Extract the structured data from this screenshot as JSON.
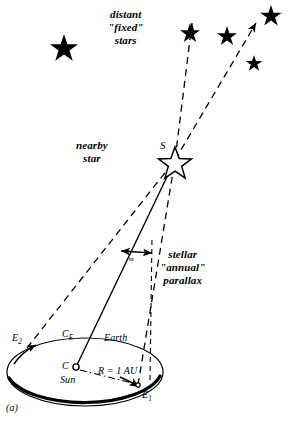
{
  "figure": {
    "panel_label": "(a)",
    "title_implicit": "stellar annual parallax geometry",
    "background_color": "#ffffff",
    "ink_color": "#000000"
  },
  "labels": {
    "distant_stars_line1": "distant",
    "distant_stars_line2": "\"fixed\"",
    "distant_stars_line3": "stars",
    "nearby_star_line1": "nearby",
    "nearby_star_line2": "star",
    "star_symbol": "S",
    "parallax_line1": "stellar",
    "parallax_line2": "\"annual\"",
    "parallax_line3": "parallax",
    "parallax_angle_symbol": "ϖ",
    "earth_position_2": "E",
    "earth_position_2_sub": "2",
    "orbit_center_label": "C",
    "orbit_center_sub": "E",
    "earth": "Earth",
    "sun_center": "C",
    "sun": "Sun",
    "radius": "R = 1 AU",
    "earth_position_1": "E",
    "earth_position_1_sub": "1"
  },
  "geometry": {
    "star_s": {
      "x": 175,
      "y": 160
    },
    "sun_c": {
      "x": 76,
      "y": 367
    },
    "earth_e1": {
      "x": 138,
      "y": 385
    },
    "earth_e2": {
      "x": 27,
      "y": 348
    },
    "orbit_center": {
      "cx": 85,
      "cy": 372,
      "rx": 78,
      "ry": 34
    },
    "baseline_au": "1 AU from Sun C to Earth E1",
    "parallax_marker_y": 250
  },
  "distant_stars": [
    {
      "id": "star-1",
      "x": 64,
      "y": 44,
      "size": 17
    },
    {
      "id": "star-2",
      "x": 190,
      "y": 30,
      "size": 12
    },
    {
      "id": "star-3",
      "x": 227,
      "y": 33,
      "size": 12
    },
    {
      "id": "star-4",
      "x": 271,
      "y": 12,
      "size": 13
    },
    {
      "id": "star-5",
      "x": 254,
      "y": 61,
      "size": 10
    }
  ]
}
